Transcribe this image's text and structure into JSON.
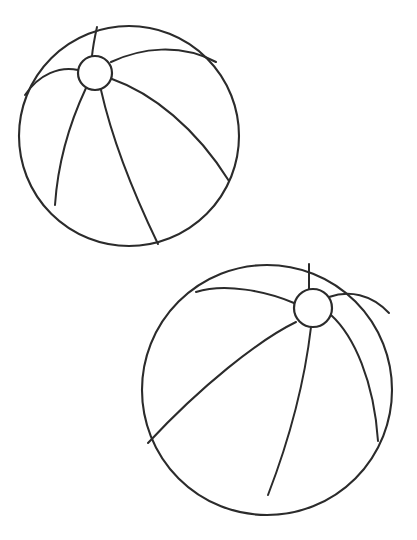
{
  "page": {
    "width": 417,
    "height": 540,
    "background_color": "#ffffff",
    "ink_color": "#2b2b2b",
    "header_text": "",
    "header_note": "clipped illegible gray text row at top edge"
  },
  "artwork": {
    "kind": "line-drawing",
    "subject": "two beach balls",
    "stroke_color": "#2b2b2b",
    "stroke_width": 2,
    "fill": "none",
    "objects": [
      {
        "name": "beach-ball-upper-left",
        "cx": 129,
        "cy": 136,
        "r": 110,
        "hub": {
          "cx": 95,
          "cy": 73,
          "r": 17
        },
        "segments": 6
      },
      {
        "name": "beach-ball-lower-right",
        "cx": 267,
        "cy": 390,
        "r": 125,
        "hub": {
          "cx": 313,
          "cy": 308,
          "r": 19
        },
        "segments": 6
      }
    ]
  }
}
